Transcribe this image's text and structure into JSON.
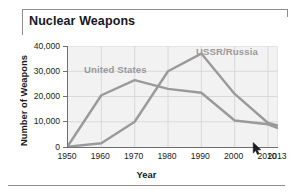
{
  "chart_data": {
    "type": "line",
    "title": "Nuclear Weapons",
    "xlabel": "Year",
    "ylabel": "Number of Weapons",
    "grid": true,
    "legend_position": "inline-annotation",
    "x": [
      1950,
      1960,
      1970,
      1980,
      1990,
      2000,
      2010,
      2013
    ],
    "xtick_labels": [
      "1950",
      "1960",
      "1970",
      "1980",
      "1990",
      "2000",
      "2010",
      "2013"
    ],
    "ytick_labels": [
      "0",
      "10,000",
      "20,000",
      "30,000",
      "40,000"
    ],
    "ytick_values": [
      0,
      10000,
      20000,
      30000,
      40000
    ],
    "xlim": [
      1950,
      2013
    ],
    "ylim": [
      0,
      40000
    ],
    "series": [
      {
        "name": "United States",
        "color": "#9a9a9a",
        "values": [
          500,
          20500,
          26500,
          23000,
          21500,
          10500,
          9000,
          7500
        ]
      },
      {
        "name": "USSR/Russia",
        "color": "#9a9a9a",
        "values": [
          100,
          1500,
          10000,
          30000,
          37000,
          21000,
          9500,
          8500
        ]
      }
    ],
    "annotations": [
      {
        "text": "United States",
        "x": 1962,
        "y": 29000
      },
      {
        "text": "USSR/Russia",
        "x": 1994,
        "y": 36000
      }
    ]
  },
  "axes": {
    "y_ticks": [
      {
        "label": "40,000",
        "value": 40000
      },
      {
        "label": "30,000",
        "value": 30000
      },
      {
        "label": "20,000",
        "value": 20000
      },
      {
        "label": "10,000",
        "value": 10000
      },
      {
        "label": "0",
        "value": 0
      }
    ],
    "x_ticks": [
      {
        "label": "1950",
        "value": 1950
      },
      {
        "label": "1960",
        "value": 1960
      },
      {
        "label": "1970",
        "value": 1970
      },
      {
        "label": "1980",
        "value": 1980
      },
      {
        "label": "1990",
        "value": 1990
      },
      {
        "label": "2000",
        "value": 2000
      },
      {
        "label": "2010",
        "value": 2010
      },
      {
        "label": "2013",
        "value": 2013
      }
    ]
  },
  "colors": {
    "line": "#9a9a9a",
    "plot_background": "#f2f2f2",
    "grid": "#d6d6d6",
    "axis": "#6f6f6f",
    "text": "#17191c",
    "frame": "#8d8d8d"
  },
  "cursor": {
    "icon": "mouse-pointer-arrow"
  }
}
